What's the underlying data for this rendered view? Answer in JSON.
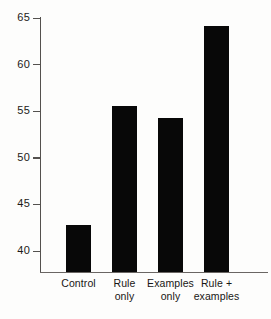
{
  "chart_data": {
    "type": "bar",
    "title": "",
    "subtitle": "",
    "xlabel": "",
    "ylabel": "",
    "ylim": [
      38.5,
      66.5
    ],
    "yticks": [
      40,
      45,
      50,
      55,
      60,
      65
    ],
    "ytick_labels": [
      "40",
      "45",
      "50",
      "55",
      "60",
      "65"
    ],
    "grid": false,
    "legend": false,
    "legend_position": "none",
    "bar_color": "#080808",
    "axis_color": "#54514e",
    "background_color": "#fdfdfc",
    "categories": [
      "Control",
      "Rule only",
      "Examples only",
      "Rule + examples"
    ],
    "category_lines": [
      [
        "Control"
      ],
      [
        "Rule",
        "only"
      ],
      [
        "Examples",
        "only"
      ],
      [
        "Rule +",
        "examples"
      ]
    ],
    "values": [
      42.8,
      55.6,
      54.3,
      64.1
    ],
    "annotations": []
  },
  "axis": {
    "ticks": [
      {
        "label": "65",
        "value": 65
      },
      {
        "label": "60",
        "value": 60
      },
      {
        "label": "55",
        "value": 55
      },
      {
        "label": "50",
        "value": 50
      },
      {
        "label": "45",
        "value": 45
      },
      {
        "label": "40",
        "value": 40
      }
    ]
  },
  "bars": [
    {
      "label_line1": "Control",
      "label_line2": "",
      "value": 42.8
    },
    {
      "label_line1": "Rule",
      "label_line2": "only",
      "value": 55.6
    },
    {
      "label_line1": "Examples",
      "label_line2": "only",
      "value": 54.3
    },
    {
      "label_line1": "Rule +",
      "label_line2": "examples",
      "value": 64.1
    }
  ]
}
